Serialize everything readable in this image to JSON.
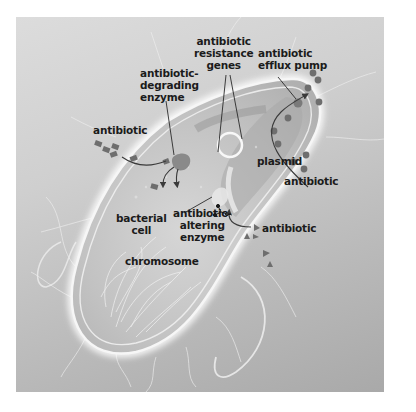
{
  "diagram": {
    "labels": {
      "antibiotic_resistance_genes": "antibiotic\nresistance\ngenes",
      "antibiotic_efflux_pump": "antibiotic\nefflux pump",
      "antibiotic_degrading_enzyme": "antibiotic-\ndegrading\nenzyme",
      "antibiotic_left": "antibiotic",
      "plasmid": "plasmid",
      "antibiotic_right": "antibiotic",
      "bacterial_cell": "bacterial\ncell",
      "antibiotic_altering_enzyme": "antibiotic-\naltering\nenzyme",
      "antibiotic_bottom": "antibiotic",
      "chromosome": "chromosome"
    },
    "colors": {
      "background_light": "#dcdcdc",
      "background_dark": "#a9a9a9",
      "cell_fill": "#c4c4c4",
      "membrane": "#f4f4f4",
      "antibiotic_marker": "#6e6e6e",
      "label_text": "#1b1b1b"
    },
    "antibiotic_shapes": {
      "left": "diamond",
      "right": "circle",
      "bottom": "triangle"
    }
  }
}
